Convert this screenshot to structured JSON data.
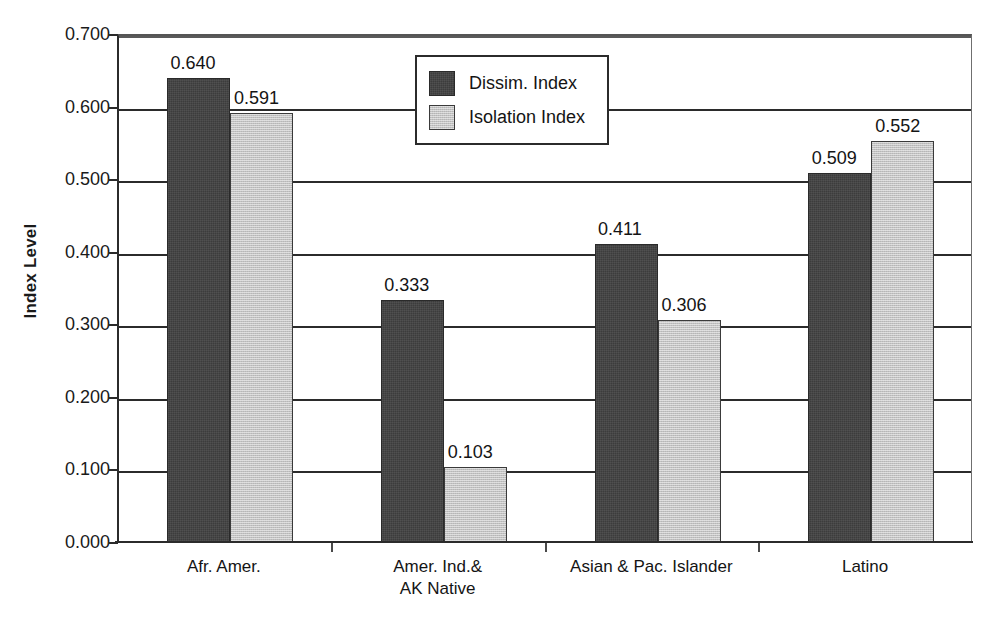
{
  "chart_data": {
    "type": "bar",
    "title": "",
    "xlabel": "",
    "ylabel": "Index Level",
    "ylim": [
      0.0,
      0.7
    ],
    "ytick_labels": [
      "0.700",
      "0.600",
      "0.500",
      "0.400",
      "0.300",
      "0.200",
      "0.100",
      "0.000"
    ],
    "ytick_values": [
      0.7,
      0.6,
      0.5,
      0.4,
      0.3,
      0.2,
      0.1,
      0.0
    ],
    "grid": true,
    "grid_axis": "y",
    "legend_position": "upper-center",
    "categories": [
      "Afr. Amer.",
      "Amer. Ind.&\nAK Native",
      "Asian & Pac. Islander",
      "Latino"
    ],
    "series": [
      {
        "name": "Dissim. Index",
        "color": "#3c3c3c",
        "values": [
          0.64,
          0.333,
          0.411,
          0.509
        ],
        "labels": [
          "0.640",
          "0.333",
          "0.411",
          "0.509"
        ]
      },
      {
        "name": "Isolation Index",
        "color": "#c2c2c2",
        "values": [
          0.591,
          0.103,
          0.306,
          0.552
        ],
        "labels": [
          "0.591",
          "0.103",
          "0.306",
          "0.552"
        ]
      }
    ]
  },
  "legend": {
    "items": [
      {
        "label": "Dissim. Index",
        "swatch": "dissim"
      },
      {
        "label": "Isolation Index",
        "swatch": "isolation"
      }
    ]
  }
}
